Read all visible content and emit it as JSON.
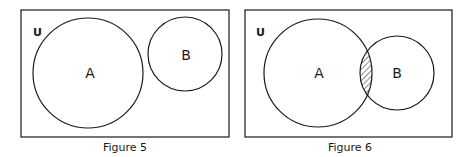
{
  "figures": [
    {
      "caption": "Figure 5",
      "universe_label": "U",
      "set_a_label": "A",
      "set_b_label": "B",
      "relationship": "disjoint"
    },
    {
      "caption": "Figure 6",
      "universe_label": "U",
      "set_a_label": "A",
      "set_b_label": "B",
      "relationship": "overlapping",
      "shaded_region": "A ∩ B"
    }
  ],
  "colors": {
    "stroke": "#1a1a1a",
    "background": "#ffffff"
  }
}
